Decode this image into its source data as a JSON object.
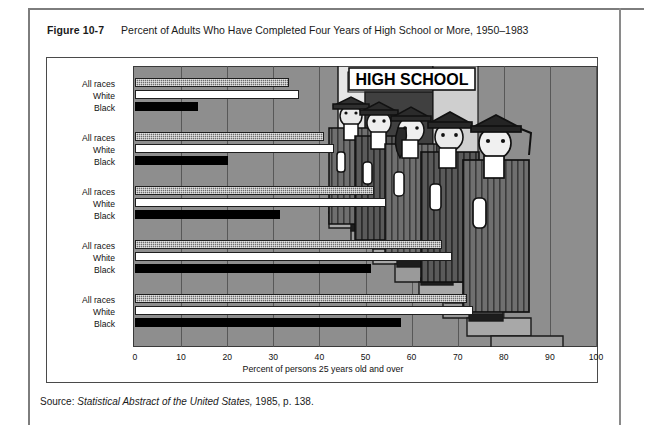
{
  "figure": {
    "number": "Figure 10-7",
    "title": "Percent of Adults Who Have Completed Four Years of High School or More, 1950–1983",
    "source_prefix": "Source: ",
    "source_italic": "Statistical Abstract of the United States,",
    "source_suffix": " 1985, p. 138."
  },
  "illustration": {
    "sign_text": "HIGH SCHOOL",
    "graduate_count": 5,
    "description": "five-graduates-on-school-steps"
  },
  "chart_data": {
    "type": "bar",
    "orientation": "horizontal",
    "title": "Percent of Adults Who Have Completed Four Years of High School or More, 1950–1983",
    "xlabel": "Percent of persons 25 years old and over",
    "ylabel": "",
    "xlim": [
      0,
      100
    ],
    "xticks": [
      0,
      10,
      20,
      30,
      40,
      50,
      60,
      70,
      80,
      90,
      100
    ],
    "grid": "vertical",
    "legend": "none",
    "categories": [
      "1950",
      "1960",
      "1970",
      "1980",
      "1983"
    ],
    "series": [
      {
        "name": "All races",
        "fill": "gray-stipple",
        "values": [
          33.4,
          41.1,
          51.9,
          66.5,
          72.1
        ]
      },
      {
        "name": "White",
        "fill": "white",
        "values": [
          35.5,
          43.2,
          54.5,
          68.8,
          73.3
        ]
      },
      {
        "name": "Black",
        "fill": "black",
        "values": [
          13.7,
          20.1,
          31.4,
          51.2,
          57.6
        ]
      }
    ],
    "groups": [
      {
        "year": "1950",
        "rows": [
          {
            "label": "All races",
            "value": 33.4
          },
          {
            "label": "White",
            "value": 35.5
          },
          {
            "label": "Black",
            "value": 13.7
          }
        ]
      },
      {
        "year": "1960",
        "rows": [
          {
            "label": "All races",
            "value": 41.1
          },
          {
            "label": "White",
            "value": 43.2
          },
          {
            "label": "Black",
            "value": 20.1
          }
        ]
      },
      {
        "year": "1970",
        "rows": [
          {
            "label": "All races",
            "value": 51.9
          },
          {
            "label": "White",
            "value": 54.5
          },
          {
            "label": "Black",
            "value": 31.4
          }
        ]
      },
      {
        "year": "1980",
        "rows": [
          {
            "label": "All races",
            "value": 66.5
          },
          {
            "label": "White",
            "value": 68.8
          },
          {
            "label": "Black",
            "value": 51.2
          }
        ]
      },
      {
        "year": "1983",
        "rows": [
          {
            "label": "All races",
            "value": 72.1
          },
          {
            "label": "White",
            "value": 73.3
          },
          {
            "label": "Black",
            "value": 57.6
          }
        ]
      }
    ]
  },
  "colors": {
    "panel": "#8e8e8e",
    "grid": "#4f4f4f",
    "bar_all": "#6d6d6d",
    "bar_white": "#ffffff",
    "bar_black": "#000000",
    "frame": "#4a4a4a",
    "text": "#1a1a1a"
  }
}
